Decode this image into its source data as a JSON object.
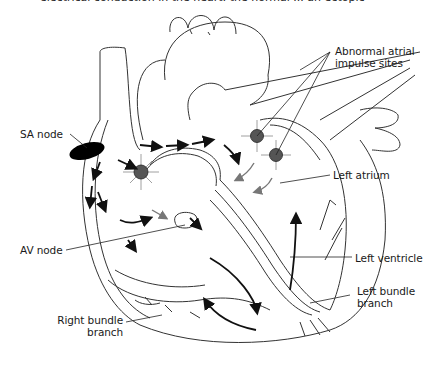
{
  "caption": "electrical conduction in the heart: the normal ... an ectopic",
  "labels": {
    "abnormal_sites_line1": "Abnormal atrial",
    "abnormal_sites_line2": "impulse sites",
    "sa_node": "SA node",
    "left_atrium": "Left atrium",
    "av_node": "AV node",
    "left_ventricle": "Left ventricle",
    "left_bundle_line1": "Left bundle",
    "left_bundle_line2": "branch",
    "right_bundle_line1": "Right bundle",
    "right_bundle_line2": "branch"
  },
  "colors": {
    "outline": "#333333",
    "node_fill": "#555555",
    "sa_node_fill": "#000000",
    "arrow_black": "#111111",
    "arrow_gray": "#777777"
  }
}
